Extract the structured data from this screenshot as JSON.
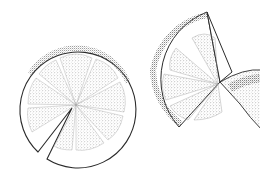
{
  "image": {
    "description": "Stippled ink illustration of citrus fruit slices: a round slice with a narrow wedge cut out, and a partial slice with an adjoining wedge piece",
    "background": "#ffffff",
    "ink_color": "#2a2a2a",
    "stipple_color": "#6b6b6b",
    "objects": [
      {
        "name": "round-citrus-slice",
        "segments": 10
      },
      {
        "name": "partial-citrus-slice",
        "segments": 5
      },
      {
        "name": "citrus-wedge-piece"
      }
    ]
  }
}
